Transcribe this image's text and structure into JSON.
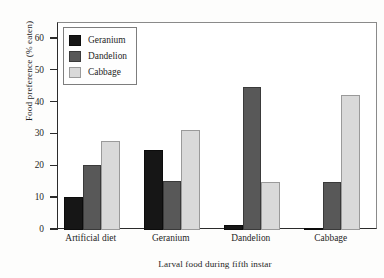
{
  "chart_data": {
    "type": "bar",
    "title": "",
    "xlabel": "Larval food during fifth instar",
    "ylabel": "Food preference (% eaten)",
    "categories": [
      "Artificial diet",
      "Geranium",
      "Dandelion",
      "Cabbage"
    ],
    "series": [
      {
        "name": "Geranium",
        "color": "#161616",
        "values": [
          10.5,
          25.0,
          1.5,
          0.5
        ]
      },
      {
        "name": "Dandelion",
        "color": "#585858",
        "values": [
          20.5,
          15.5,
          45.0,
          15.0
        ]
      },
      {
        "name": "Cabbage",
        "color": "#d9d9d9",
        "values": [
          28.0,
          31.5,
          15.0,
          42.5
        ]
      }
    ],
    "ylim": [
      0,
      65
    ],
    "yticks": [
      0,
      10,
      20,
      30,
      40,
      50,
      60
    ],
    "ytick_labels": [
      "0",
      "10",
      "20",
      "30",
      "40",
      "50",
      "60"
    ],
    "grid": false,
    "legend_position": "upper-left",
    "legend_entries": [
      "Geranium",
      "Dandelion",
      "Cabbage"
    ]
  }
}
